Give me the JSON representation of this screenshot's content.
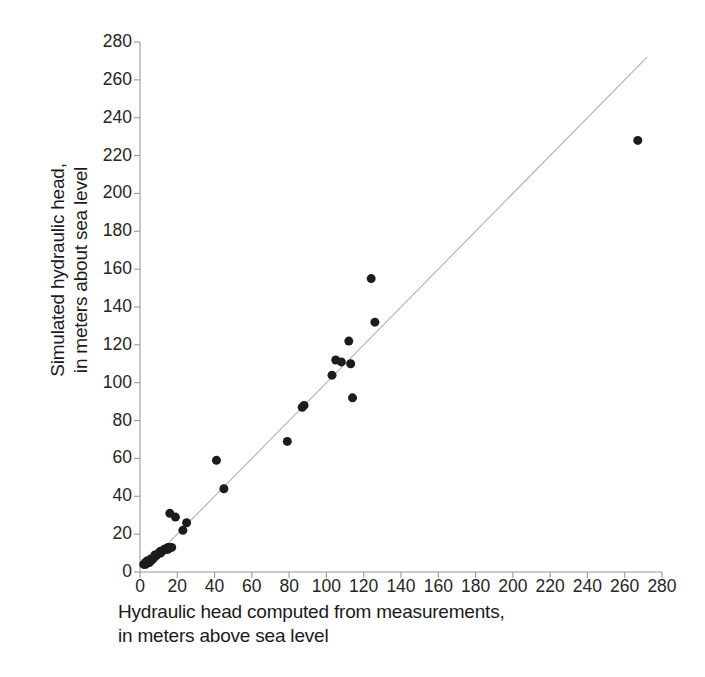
{
  "chart_data": {
    "type": "scatter",
    "title": "",
    "subtitle": "",
    "xlabel_lines": [
      "Hydraulic head computed from measurements,",
      "in meters above sea level"
    ],
    "ylabel_lines": [
      "Simulated hydraulic head,",
      "in meters about sea level"
    ],
    "xlabel": "Hydraulic head computed from measurements, in meters above sea level",
    "ylabel": "Simulated hydraulic head, in meters about sea level",
    "xlim": [
      0,
      280
    ],
    "ylim": [
      0,
      280
    ],
    "xticks": [
      0,
      20,
      40,
      60,
      80,
      100,
      120,
      140,
      160,
      180,
      200,
      220,
      240,
      260,
      280
    ],
    "yticks": [
      0,
      20,
      40,
      60,
      80,
      100,
      120,
      140,
      160,
      180,
      200,
      220,
      240,
      260,
      280
    ],
    "grid": false,
    "legend": "none",
    "marker": "filled-circle",
    "marker_color": "#1c1c1c",
    "marker_size_px": 9,
    "reference_line": {
      "name": "1:1 line",
      "from": [
        2,
        2
      ],
      "to": [
        272,
        272
      ],
      "color": "#b0b0b0"
    },
    "series": [
      {
        "name": "Simulated vs computed hydraulic head",
        "points": [
          [
            2,
            4
          ],
          [
            3,
            4
          ],
          [
            3,
            5
          ],
          [
            4,
            5
          ],
          [
            4,
            6
          ],
          [
            5,
            5
          ],
          [
            5,
            6
          ],
          [
            6,
            6
          ],
          [
            6,
            7
          ],
          [
            7,
            7
          ],
          [
            8,
            8
          ],
          [
            8,
            9
          ],
          [
            9,
            9
          ],
          [
            10,
            10
          ],
          [
            11,
            10
          ],
          [
            11,
            11
          ],
          [
            12,
            11
          ],
          [
            13,
            12
          ],
          [
            14,
            12
          ],
          [
            15,
            12
          ],
          [
            15,
            13
          ],
          [
            16,
            13
          ],
          [
            17,
            13
          ],
          [
            16,
            31
          ],
          [
            19,
            29
          ],
          [
            23,
            22
          ],
          [
            25,
            26
          ],
          [
            41,
            59
          ],
          [
            45,
            44
          ],
          [
            79,
            69
          ],
          [
            87,
            87
          ],
          [
            88,
            88
          ],
          [
            103,
            104
          ],
          [
            105,
            112
          ],
          [
            108,
            111
          ],
          [
            112,
            122
          ],
          [
            113,
            110
          ],
          [
            114,
            92
          ],
          [
            124,
            155
          ],
          [
            126,
            132
          ],
          [
            267,
            228
          ]
        ]
      }
    ]
  },
  "axis": {
    "x_color": "#9a9a9a",
    "y_color": "#9a9a9a",
    "tick_label_color": "#262626"
  }
}
